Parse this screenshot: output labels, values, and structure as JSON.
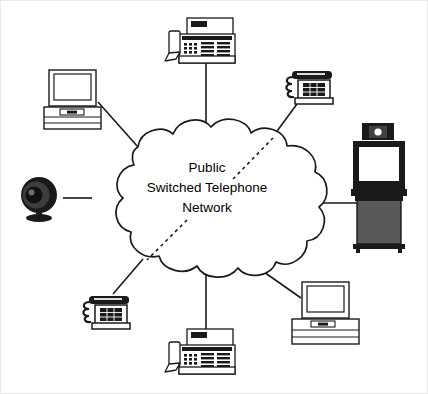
{
  "diagram": {
    "canvas": {
      "width": 428,
      "height": 394,
      "background": "#ffffff"
    },
    "cloud": {
      "name": "public-switched-telephone-network-cloud",
      "label_lines": [
        "Public",
        "Switched Telephone",
        "Network"
      ],
      "line1": "Public",
      "line2": "Switched Telephone",
      "line3": "Network",
      "fill": "#ffffff",
      "stroke": "#1a1a1a"
    },
    "colors": {
      "line": "#1a1a1a",
      "device_outline": "#1a1a1a",
      "device_fill": "#ffffff",
      "device_shade": "#cccccc",
      "device_dark": "#262626",
      "text": "#000000"
    },
    "nodes": [
      {
        "id": "office-phone-top",
        "label": "Business telephone",
        "icon": "office-phone-icon",
        "position": "top"
      },
      {
        "id": "desktop-computer-upper-left",
        "label": "Desktop computer",
        "icon": "desktop-computer-icon",
        "position": "upper-left"
      },
      {
        "id": "desk-phone-upper-right",
        "label": "Desk telephone",
        "icon": "desk-phone-icon",
        "position": "upper-right"
      },
      {
        "id": "videoconference-unit-right",
        "label": "Videoconferencing unit",
        "icon": "videoconference-cart-icon",
        "position": "right"
      },
      {
        "id": "webcam-left",
        "label": "Video camera",
        "icon": "webcam-icon",
        "position": "left"
      },
      {
        "id": "desk-phone-lower-left",
        "label": "Desk telephone",
        "icon": "desk-phone-icon",
        "position": "lower-left"
      },
      {
        "id": "office-phone-bottom",
        "label": "Business telephone",
        "icon": "office-phone-icon",
        "position": "bottom"
      },
      {
        "id": "desktop-computer-lower-right",
        "label": "Desktop computer",
        "icon": "desktop-computer-icon",
        "position": "lower-right"
      }
    ],
    "links": [
      {
        "id": "link-office-phone-top",
        "style": "solid"
      },
      {
        "id": "link-desktop-upper-left",
        "style": "solid"
      },
      {
        "id": "link-desk-phone-upper-right",
        "style": "solid-with-dashed-interior"
      },
      {
        "id": "link-videoconference-right",
        "style": "solid"
      },
      {
        "id": "link-webcam-left",
        "style": "solid"
      },
      {
        "id": "link-desk-phone-lower-left",
        "style": "solid-with-dashed-interior"
      },
      {
        "id": "link-office-phone-bottom",
        "style": "solid"
      },
      {
        "id": "link-desktop-lower-right",
        "style": "solid"
      }
    ]
  }
}
